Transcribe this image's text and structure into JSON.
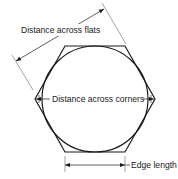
{
  "diagram": {
    "labels": {
      "across_flats": "Distance across flats",
      "across_corners": "Distance across corners",
      "edge_length": "Edge length"
    },
    "colors": {
      "line": "#1a1a1a",
      "thin_line": "#555555",
      "background": "#ffffff"
    }
  }
}
